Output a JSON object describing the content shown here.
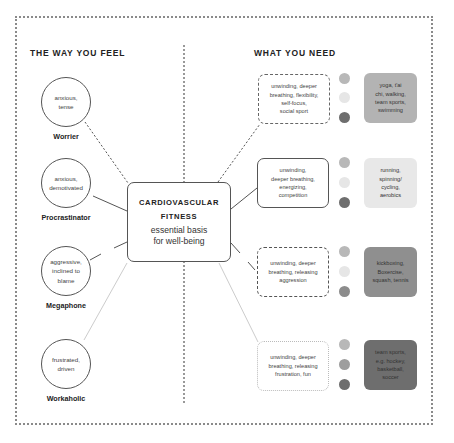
{
  "left_heading": "THE WAY YOU FEEL",
  "right_heading": "WHAT YOU NEED",
  "center": {
    "title_line1": "CARDIOVASCULAR",
    "title_line2": "FITNESS",
    "subtitle_line1": "essential basis",
    "subtitle_line2": "for well-being"
  },
  "personas": [
    {
      "feeling_line1": "anxious,",
      "feeling_line2": "tense",
      "feeling_line3": "",
      "name": "Worrier"
    },
    {
      "feeling_line1": "anxious,",
      "feeling_line2": "demotivated",
      "feeling_line3": "",
      "name": "Procrastinator"
    },
    {
      "feeling_line1": "aggressive,",
      "feeling_line2": "inclined to",
      "feeling_line3": "blame",
      "name": "Megaphone"
    },
    {
      "feeling_line1": "frustrated,",
      "feeling_line2": "driven",
      "feeling_line3": "",
      "name": "Workaholic"
    }
  ],
  "needs": [
    {
      "lines": [
        "unwinding, deeper",
        "breathing, flexibility,",
        "self-focus,",
        "social sport"
      ],
      "activity": [
        "yoga, t'ai",
        "chi, walking,",
        "team sports,",
        "swimming"
      ],
      "activity_color": "#b3b3b3",
      "dot_colors": [
        "#b8b8b8",
        "#e6e6e6",
        "#6e6e6e"
      ]
    },
    {
      "lines": [
        "unwinding,",
        "deeper breathing,",
        "energizing,",
        "competition"
      ],
      "activity": [
        "running,",
        "spinning/",
        "cycling,",
        "aerobics"
      ],
      "activity_color": "#e8e8e8",
      "dot_colors": [
        "#b8b8b8",
        "#e6e6e6",
        "#6e6e6e"
      ]
    },
    {
      "lines": [
        "unwinding, deeper",
        "breathing, releasing",
        "aggression"
      ],
      "activity": [
        "kickboxing,",
        "Boxercise,",
        "squash, tennis"
      ],
      "activity_color": "#8f8f8f",
      "dot_colors": [
        "#b8b8b8",
        "#e6e6e6",
        "#8c8c8c"
      ]
    },
    {
      "lines": [
        "unwinding, deeper",
        "breathing, releasing",
        "frustration, fun"
      ],
      "activity": [
        "team sports,",
        "e.g. hockey,",
        "basketball,",
        "soccer"
      ],
      "activity_color": "#6e6e6e",
      "dot_colors": [
        "#b8b8b8",
        "#9e9e9e",
        "#6e6e6e"
      ]
    }
  ]
}
